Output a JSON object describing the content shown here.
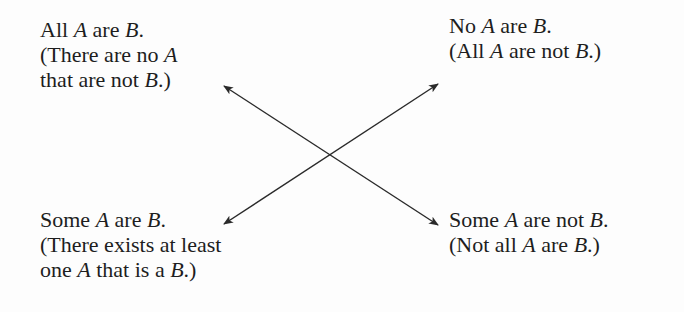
{
  "diagram": {
    "type": "square-of-opposition",
    "nodes": {
      "top_left": {
        "lines": [
          [
            {
              "t": "All "
            },
            {
              "t": "A",
              "i": true
            },
            {
              "t": " are "
            },
            {
              "t": "B",
              "i": true
            },
            {
              "t": "."
            }
          ],
          [
            {
              "t": "(There are no "
            },
            {
              "t": "A",
              "i": true
            }
          ],
          [
            {
              "t": "that are not "
            },
            {
              "t": "B",
              "i": true
            },
            {
              "t": ".)"
            }
          ]
        ]
      },
      "top_right": {
        "lines": [
          [
            {
              "t": "No "
            },
            {
              "t": "A",
              "i": true
            },
            {
              "t": " are "
            },
            {
              "t": "B",
              "i": true
            },
            {
              "t": "."
            }
          ],
          [
            {
              "t": "(All "
            },
            {
              "t": "A",
              "i": true
            },
            {
              "t": " are not "
            },
            {
              "t": "B",
              "i": true
            },
            {
              "t": ".)"
            }
          ]
        ]
      },
      "bottom_left": {
        "lines": [
          [
            {
              "t": "Some "
            },
            {
              "t": "A",
              "i": true
            },
            {
              "t": " are "
            },
            {
              "t": "B",
              "i": true
            },
            {
              "t": "."
            }
          ],
          [
            {
              "t": "(There exists at least"
            }
          ],
          [
            {
              "t": "one "
            },
            {
              "t": "A",
              "i": true
            },
            {
              "t": " that is a "
            },
            {
              "t": "B",
              "i": true
            },
            {
              "t": ".)"
            }
          ]
        ]
      },
      "bottom_right": {
        "lines": [
          [
            {
              "t": "Some "
            },
            {
              "t": "A",
              "i": true
            },
            {
              "t": " are not "
            },
            {
              "t": "B",
              "i": true
            },
            {
              "t": "."
            }
          ],
          [
            {
              "t": "(Not all "
            },
            {
              "t": "A",
              "i": true
            },
            {
              "t": " are "
            },
            {
              "t": "B",
              "i": true
            },
            {
              "t": ".)"
            }
          ]
        ]
      }
    },
    "edges": [
      {
        "from": "top_left",
        "to": "bottom_right",
        "relation": "negation",
        "bidirectional": true
      },
      {
        "from": "top_right",
        "to": "bottom_left",
        "relation": "negation",
        "bidirectional": true
      }
    ],
    "colors": {
      "text": "#1e1e1e",
      "arrow": "#2a2a2a",
      "background": "#fdfdfd"
    }
  }
}
